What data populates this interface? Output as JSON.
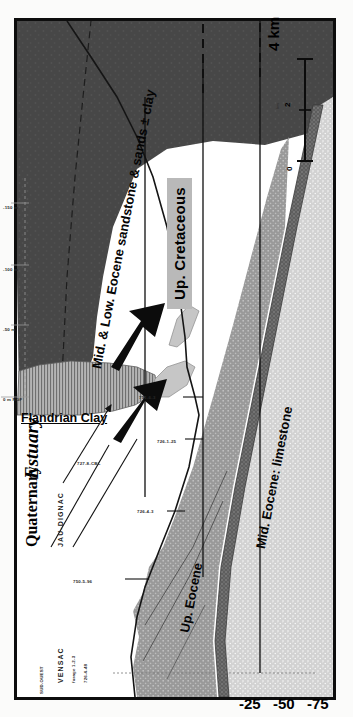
{
  "figure": {
    "type": "geological-cross-section",
    "orientation": "rotated-90-ccw",
    "towns": [
      {
        "name": "VENSAC"
      },
      {
        "name": "JAU-DIGNAC"
      }
    ],
    "units": [
      {
        "id": "up-cretaceous",
        "label": "Up. Cretaceous",
        "color": "#4a4a4a",
        "boxed": true
      },
      {
        "id": "mid-low-eocene",
        "label": "Mid. & Low. Eocene sandstone & sands ± clay",
        "color": "#ffffff"
      },
      {
        "id": "mid-eocene-ls",
        "label": "Mid. Eocene: limestone",
        "color": "#c9c9c9"
      },
      {
        "id": "up-eocene",
        "label": "Up. Eocene",
        "color": "#8f8f8f"
      },
      {
        "id": "flandrian-clay",
        "label": "Flandrian Clay",
        "color": "#a8a8a8"
      },
      {
        "id": "quaternary",
        "label": "Quaternary",
        "color": "#cfcfcf"
      },
      {
        "id": "estuary",
        "label": "Estuary",
        "color": "#ffffff"
      }
    ],
    "depth_axis": {
      "unit": "m",
      "ticks": [
        "-25",
        "-50",
        "-75"
      ]
    },
    "scale_bar": {
      "caption": "km",
      "end_label": "4 km",
      "ticks": [
        "0",
        "2",
        "4"
      ]
    },
    "boreholes": [
      {
        "id": "bh1",
        "label": "726-6-48"
      },
      {
        "id": "bh2",
        "label": "750-5-96"
      },
      {
        "id": "bh3",
        "label": "726-4-3"
      },
      {
        "id": "bh4",
        "label": "726-1-25"
      },
      {
        "id": "bh5",
        "label": "727-8-CBL"
      },
      {
        "id": "bh6",
        "label": "751-6-3"
      },
      {
        "id": "bh7",
        "label": "0 m NGF"
      },
      {
        "id": "bh8",
        "label": "-50 m"
      },
      {
        "id": "bh9",
        "label": "-100 m"
      },
      {
        "id": "bh10",
        "label": "-150 m"
      }
    ],
    "corner_note": "SUD-OUEST",
    "town_sub": [
      {
        "label": "forage 1-2-3"
      },
      {
        "label": "726-4-48"
      }
    ]
  }
}
